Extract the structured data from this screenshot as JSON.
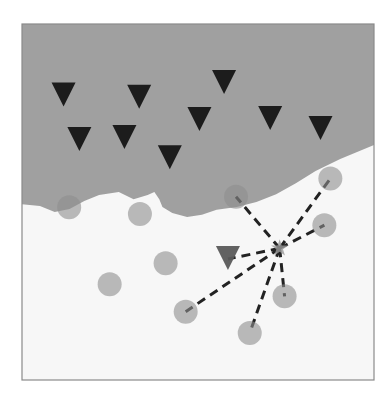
{
  "figure": {
    "type": "knn-classification-diagram",
    "colors": {
      "frame": "#8a8a8a",
      "background": "#f7f7f7",
      "class_region_triangle": "#a0a0a0",
      "class_region_circle": "#f7f7f7",
      "triangle_marker": "#1c1c1c",
      "query_triangle_marker": "#5a5a5a",
      "circle_marker": "#8e8e8e",
      "circle_opacity": 0.6,
      "neighbor_line": "#222222",
      "query_star": "#9a9a9a"
    },
    "classes": [
      {
        "name": "triangle",
        "region": "upper"
      },
      {
        "name": "circle",
        "region": "lower"
      }
    ],
    "points_units": "normalized plot coordinates (0-1 from left/top of frame)",
    "triangles": [
      {
        "x": 0.118,
        "y": 0.201
      },
      {
        "x": 0.333,
        "y": 0.207
      },
      {
        "x": 0.163,
        "y": 0.326
      },
      {
        "x": 0.291,
        "y": 0.32
      },
      {
        "x": 0.42,
        "y": 0.377
      },
      {
        "x": 0.574,
        "y": 0.166
      },
      {
        "x": 0.504,
        "y": 0.27
      },
      {
        "x": 0.705,
        "y": 0.267
      },
      {
        "x": 0.848,
        "y": 0.295
      }
    ],
    "circles": [
      {
        "x": 0.134,
        "y": 0.515
      },
      {
        "x": 0.335,
        "y": 0.534
      },
      {
        "x": 0.408,
        "y": 0.672
      },
      {
        "x": 0.249,
        "y": 0.731
      },
      {
        "x": 0.608,
        "y": 0.485
      },
      {
        "x": 0.876,
        "y": 0.434
      },
      {
        "x": 0.859,
        "y": 0.565
      },
      {
        "x": 0.746,
        "y": 0.765
      },
      {
        "x": 0.465,
        "y": 0.808
      },
      {
        "x": 0.647,
        "y": 0.868
      }
    ],
    "query_point": {
      "x": 0.732,
      "y": 0.63
    },
    "neighbor_triangle": {
      "x": 0.585,
      "y": 0.66
    },
    "neighbors": [
      {
        "kind": "circle",
        "index": 4
      },
      {
        "kind": "circle",
        "index": 5
      },
      {
        "kind": "circle",
        "index": 6
      },
      {
        "kind": "circle",
        "index": 7
      },
      {
        "kind": "circle",
        "index": 8
      },
      {
        "kind": "circle",
        "index": 9
      },
      {
        "kind": "neighbor_triangle",
        "index": 0
      }
    ],
    "boundary": [
      [
        0.0,
        0.506
      ],
      [
        0.051,
        0.511
      ],
      [
        0.093,
        0.528
      ],
      [
        0.135,
        0.52
      ],
      [
        0.177,
        0.497
      ],
      [
        0.219,
        0.48
      ],
      [
        0.275,
        0.472
      ],
      [
        0.317,
        0.492
      ],
      [
        0.357,
        0.48
      ],
      [
        0.376,
        0.472
      ],
      [
        0.39,
        0.492
      ],
      [
        0.399,
        0.514
      ],
      [
        0.427,
        0.531
      ],
      [
        0.469,
        0.542
      ],
      [
        0.511,
        0.536
      ],
      [
        0.553,
        0.522
      ],
      [
        0.61,
        0.514
      ],
      [
        0.666,
        0.5
      ],
      [
        0.722,
        0.478
      ],
      [
        0.778,
        0.447
      ],
      [
        0.834,
        0.413
      ],
      [
        0.904,
        0.379
      ],
      [
        1.0,
        0.34
      ]
    ]
  }
}
